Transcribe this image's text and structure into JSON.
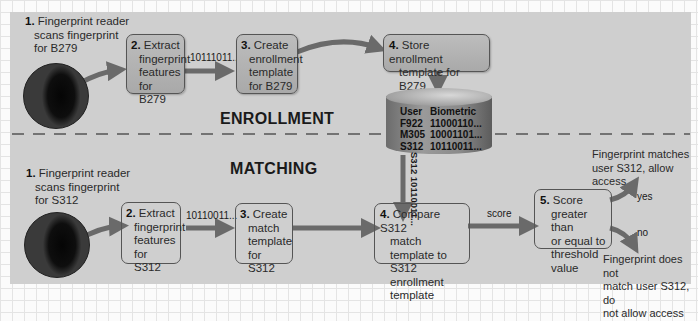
{
  "sections": {
    "enrollment": "ENROLLMENT",
    "matching": "MATCHING"
  },
  "enrollment": {
    "step1": {
      "num": "1.",
      "lines": [
        "Fingerprint reader",
        "scans fingerprint",
        "for B279"
      ]
    },
    "step2": {
      "num": "2.",
      "lines": [
        "Extract",
        "fingerprint",
        "features",
        "for B279"
      ]
    },
    "data_2_3": "10111011...",
    "step3": {
      "num": "3.",
      "lines": [
        "Create",
        "enrollment",
        "template",
        "for B279"
      ]
    },
    "step4": {
      "num": "4.",
      "lines": [
        "Store enrollment",
        "template for B279"
      ]
    }
  },
  "database": {
    "headers": [
      "User",
      "Biometric"
    ],
    "rows": [
      [
        "F922",
        "11000110..."
      ],
      [
        "M305",
        "10001101..."
      ],
      [
        "S312",
        "10110011..."
      ]
    ],
    "output_label": "S312 10110011..."
  },
  "matching": {
    "step1": {
      "num": "1.",
      "lines": [
        "Fingerprint reader",
        "scans fingerprint",
        "for S312"
      ]
    },
    "step2": {
      "num": "2.",
      "lines": [
        "Extract",
        "fingerprint",
        "features",
        "for S312"
      ]
    },
    "data_2_3": "10110011...",
    "step3": {
      "num": "3.",
      "lines": [
        "Create",
        "match",
        "template",
        "for S312"
      ]
    },
    "step4": {
      "num": "4.",
      "lines": [
        "Compare S312",
        "match template to",
        "S312 enrollment",
        "template"
      ]
    },
    "data_4_5": "score",
    "step5": {
      "num": "5.",
      "lines": [
        "Score",
        "greater than",
        "or equal to",
        "threshold value"
      ]
    },
    "yes_label": "yes",
    "no_label": "no",
    "yes_outcome": [
      "Fingerprint matches",
      "user S312, allow access"
    ],
    "no_outcome": [
      "Fingerprint does not",
      "match user S312, do",
      "not allow access"
    ]
  },
  "colors": {
    "panel": "#cfcfcf",
    "arrow": "#6a6a6a",
    "box_border": "#555555",
    "enroll_box_fill": "#b3b3b3"
  }
}
